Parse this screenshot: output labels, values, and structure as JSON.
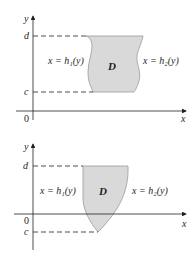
{
  "figures": [
    {
      "id": "type-II-region-1",
      "axis_labels": {
        "x": "x",
        "y": "y"
      },
      "origin_label": "0",
      "bound_labels": {
        "top": "d",
        "bottom": "c"
      },
      "region_label": "D",
      "left_curve_label": "x = h₁(y)",
      "right_curve_label": "x = h₂(y)"
    },
    {
      "id": "type-II-region-2",
      "axis_labels": {
        "x": "x",
        "y": "y"
      },
      "origin_label": "0",
      "bound_labels": {
        "top": "d",
        "bottom": "c"
      },
      "region_label": "D",
      "left_curve_label": "x = h₁(y)",
      "right_curve_label": "x = h₂(y)"
    }
  ],
  "colors": {
    "region_fill": "#d9d9d9",
    "region_stroke": "#8a8a8a",
    "axis": "#231f20",
    "dash": "#231f20"
  }
}
